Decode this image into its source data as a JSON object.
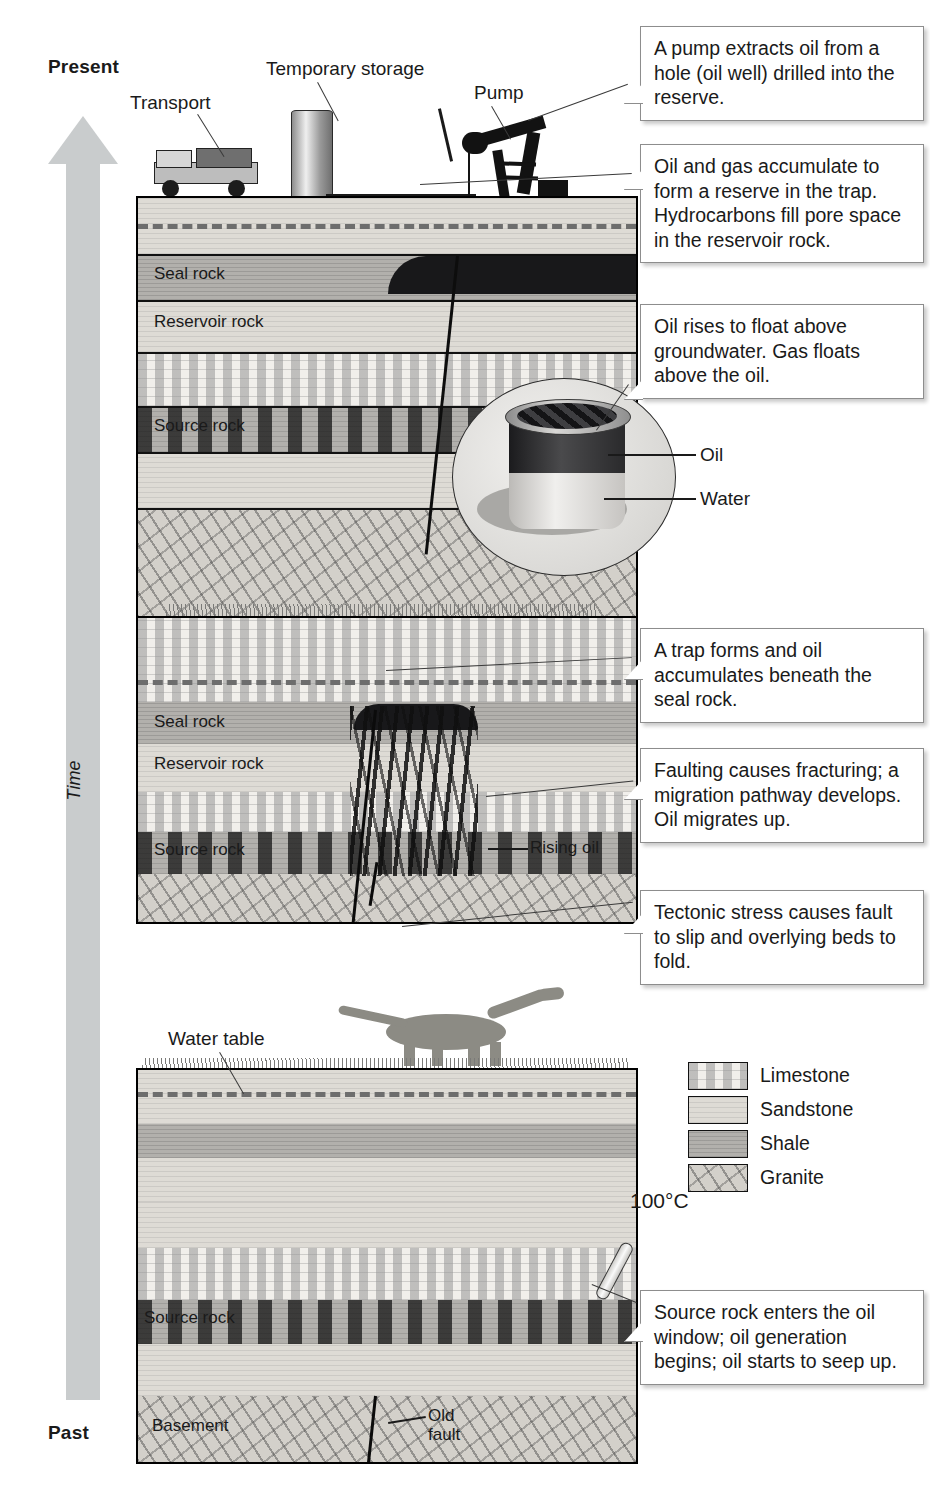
{
  "figure": {
    "time_axis": {
      "top_label": "Present",
      "bottom_label": "Past",
      "axis_word": "Time",
      "direction": "upward",
      "arrow_color": "#c9cccd"
    }
  },
  "panels": [
    {
      "id": "panel-present",
      "stage": "Present — extraction",
      "surface_labels": [
        {
          "name": "transport",
          "text": "Transport"
        },
        {
          "name": "temporary-storage",
          "text": "Temporary storage"
        },
        {
          "name": "pump",
          "text": "Pump"
        }
      ],
      "rock_labels": [
        {
          "name": "seal-rock",
          "text": "Seal rock"
        },
        {
          "name": "reservoir-rock",
          "text": "Reservoir rock"
        },
        {
          "name": "source-rock",
          "text": "Source rock"
        }
      ],
      "inset": {
        "name": "oil-water-beaker-inset",
        "labels": [
          {
            "name": "oil",
            "text": "Oil"
          },
          {
            "name": "water",
            "text": "Water"
          }
        ]
      },
      "callouts": [
        {
          "name": "callout-pump",
          "text": "A pump extracts oil from a hole (oil well) drilled into the reserve."
        },
        {
          "name": "callout-reserve",
          "text": "Oil and gas accumulate to form a reserve in the trap. Hydrocarbons fill pore space in the reservoir rock."
        },
        {
          "name": "callout-buoyancy",
          "text": "Oil rises to float above groundwater. Gas floats above the oil."
        }
      ]
    },
    {
      "id": "panel-trap-forms",
      "stage": "Middle — faulting, folding and trapping",
      "rock_labels": [
        {
          "name": "seal-rock",
          "text": "Seal rock"
        },
        {
          "name": "reservoir-rock",
          "text": "Reservoir rock"
        },
        {
          "name": "source-rock",
          "text": "Source rock"
        },
        {
          "name": "rising-oil",
          "text": "Rising oil"
        }
      ],
      "callouts": [
        {
          "name": "callout-trap",
          "text": "A trap forms and oil accumulates beneath the seal rock."
        },
        {
          "name": "callout-faulting",
          "text": "Faulting causes fracturing; a migration pathway develops. Oil migrates up."
        },
        {
          "name": "callout-tectonics",
          "text": "Tectonic stress causes fault to slip and overlying beds to fold."
        }
      ]
    },
    {
      "id": "panel-past",
      "stage": "Past — source rock maturation",
      "rock_labels": [
        {
          "name": "water-table",
          "text": "Water table"
        },
        {
          "name": "source-rock",
          "text": "Source rock"
        },
        {
          "name": "basement",
          "text": "Basement"
        },
        {
          "name": "old-fault",
          "text": "Old\nfault"
        }
      ],
      "temperature": {
        "name": "oil-window-temperature",
        "text": "100°C"
      },
      "callouts": [
        {
          "name": "callout-oil-window",
          "text": "Source rock enters the oil window; oil generation begins; oil starts to seep up."
        }
      ]
    }
  ],
  "legend": {
    "name": "rock-type-legend",
    "items": [
      {
        "label": "Limestone",
        "fill": "#f1efeb"
      },
      {
        "label": "Sandstone",
        "fill": "#dedbd5"
      },
      {
        "label": "Shale",
        "fill": "#b2b0ac"
      },
      {
        "label": "Granite",
        "fill": "#d3d0ca"
      }
    ]
  }
}
